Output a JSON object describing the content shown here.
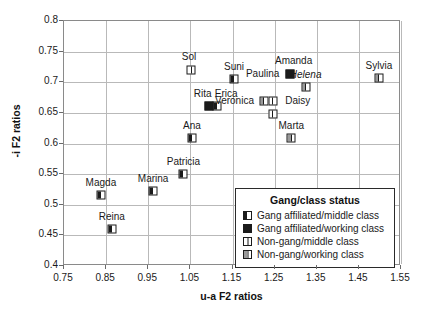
{
  "chart_data": {
    "type": "scatter",
    "title": "",
    "xlabel": "u-a F2 ratios",
    "ylabel": "-i F2 ratios",
    "xlim": [
      0.75,
      1.55
    ],
    "ylim": [
      0.4,
      0.8
    ],
    "xticks": [
      "0.75",
      "0.85",
      "0.95",
      "1.05",
      "1.15",
      "1.25",
      "1.35",
      "1.45",
      "1.55"
    ],
    "yticks": [
      "0.4",
      "0.45",
      "0.5",
      "0.55",
      "0.6",
      "0.65",
      "0.7",
      "0.75",
      "0.8"
    ],
    "grid": true,
    "legend_position": "inside-lower-right",
    "legend": {
      "title": "Gang/class status",
      "entries": [
        {
          "key": "gm",
          "label": "Gang affiliated/middle class"
        },
        {
          "key": "gw",
          "label": "Gang affiliated/working class"
        },
        {
          "key": "nm",
          "label": "Non-gang/middle class"
        },
        {
          "key": "nw",
          "label": "Non-gang/working class"
        }
      ]
    },
    "points": [
      {
        "name": "Magda",
        "x": 0.84,
        "y": 0.515,
        "group": "gm",
        "label_dx": 0,
        "label_dy": -13,
        "italic": false
      },
      {
        "name": "Reina",
        "x": 0.866,
        "y": 0.458,
        "group": "gm",
        "label_dx": 0,
        "label_dy": -13,
        "italic": false
      },
      {
        "name": "Marina",
        "x": 0.964,
        "y": 0.521,
        "group": "gm",
        "label_dx": 0,
        "label_dy": -13,
        "italic": false
      },
      {
        "name": "Patricia",
        "x": 1.036,
        "y": 0.548,
        "group": "gm",
        "label_dx": 0,
        "label_dy": -13,
        "italic": false
      },
      {
        "name": "Ana",
        "x": 1.056,
        "y": 0.607,
        "group": "gm",
        "label_dx": 0,
        "label_dy": -13,
        "italic": false
      },
      {
        "name": "Sol",
        "x": 1.054,
        "y": 0.718,
        "group": "nm",
        "label_dx": -2,
        "label_dy": -14,
        "italic": false
      },
      {
        "name": "Rita",
        "x": 1.096,
        "y": 0.66,
        "group": "gw",
        "label_dx": -6,
        "label_dy": -13,
        "italic": false
      },
      {
        "name": "Erica",
        "x": 1.116,
        "y": 0.66,
        "group": "gm",
        "label_dx": 9,
        "label_dy": -13,
        "italic": false
      },
      {
        "name": "Suni",
        "x": 1.156,
        "y": 0.704,
        "group": "gm",
        "label_dx": 0,
        "label_dy": -13,
        "italic": false
      },
      {
        "name": "Veronica",
        "x": 1.226,
        "y": 0.668,
        "group": "nw",
        "label_dx": -29,
        "label_dy": -1,
        "italic": false
      },
      {
        "name": "Daisy",
        "x": 1.248,
        "y": 0.668,
        "group": "nm",
        "label_dx": 25,
        "label_dy": -1,
        "italic": false
      },
      {
        "name": "Paulina",
        "x": 1.288,
        "y": 0.712,
        "group": "gw",
        "label_dx": -27,
        "label_dy": -1,
        "italic": false
      },
      {
        "name": "Amanda",
        "x": 1.288,
        "y": 0.712,
        "group": "none",
        "label_dx": 4,
        "label_dy": -14,
        "italic": false
      },
      {
        "name": "Helena",
        "x": 1.326,
        "y": 0.69,
        "group": "nw",
        "label_dx": 0,
        "label_dy": -13,
        "italic": true
      },
      {
        "name": "Marta",
        "x": 1.292,
        "y": 0.607,
        "group": "nw",
        "label_dx": 0,
        "label_dy": -13,
        "italic": false
      },
      {
        "name": "Sylvia",
        "x": 1.5,
        "y": 0.705,
        "group": "nw",
        "label_dx": 0,
        "label_dy": -13,
        "italic": false
      },
      {
        "name": "DaisyPt",
        "x": 1.248,
        "y": 0.646,
        "group": "nm",
        "label_dx": 0,
        "label_dy": 0,
        "italic": false,
        "hide_label": true
      }
    ]
  }
}
